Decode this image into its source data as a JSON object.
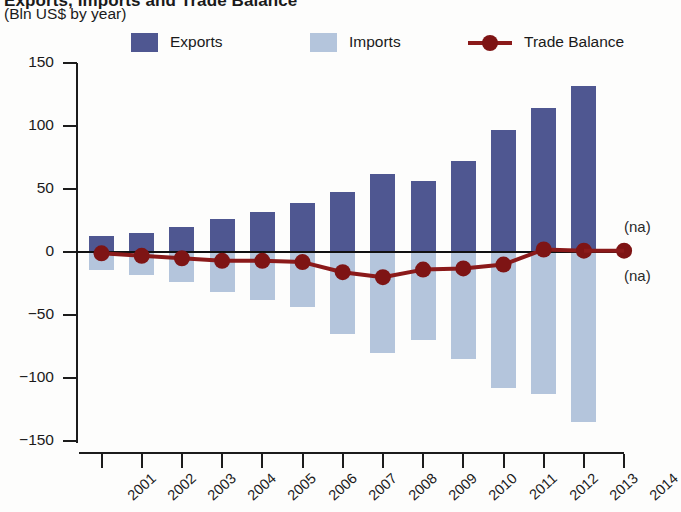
{
  "header": {
    "title_fragment": "Exports, Imports and Trade Balance",
    "subtitle": "(Bln US$ by year)"
  },
  "legend": {
    "position": "top",
    "items": [
      {
        "label": "Exports",
        "marker": "square-swatch",
        "color": "#4f5791"
      },
      {
        "label": "Imports",
        "marker": "square-swatch",
        "color": "#b4c5dc"
      },
      {
        "label": "Trade Balance",
        "marker": "line-with-marker",
        "color": "#8b1a1a"
      }
    ]
  },
  "annotations": [
    {
      "name": "na-upper",
      "text": "(na)",
      "x": 2014,
      "y": 19
    },
    {
      "name": "na-lower",
      "text": "(na)",
      "x": 2014,
      "y": -20
    }
  ],
  "colors": {
    "exports": "#4f5791",
    "imports": "#b4c5dc",
    "trade_balance": "#8b1a1a",
    "trade_balance_marker": "#7e1414",
    "axis": "#1c1c1c",
    "background": "#fdfdfc"
  },
  "chart_data": {
    "type": "bar",
    "title": "Exports, Imports and Trade Balance",
    "subtitle": "(Bln US$ by year)",
    "xlabel": "",
    "ylabel": "Bln US$ by year",
    "categories": [
      "2001",
      "2002",
      "2003",
      "2004",
      "2005",
      "2006",
      "2007",
      "2008",
      "2009",
      "2010",
      "2011",
      "2012",
      "2013",
      "2014"
    ],
    "tick_labels": [
      "2001",
      "2002",
      "2003",
      "2004",
      "2005",
      "2006",
      "2007",
      "2008",
      "2009",
      "2010",
      "2011",
      "2012",
      "2013",
      "2014"
    ],
    "ytick_labels": [
      "150",
      "100",
      "50",
      "0",
      "-50",
      "-100",
      "-150"
    ],
    "ytick_values": [
      150,
      100,
      50,
      0,
      -50,
      -100,
      -150
    ],
    "ylim": [
      -150,
      150
    ],
    "grid": false,
    "series": [
      {
        "name": "Exports",
        "type": "bar",
        "color": "#4f5791",
        "x": [
          "2001",
          "2002",
          "2003",
          "2004",
          "2005",
          "2006",
          "2007",
          "2008",
          "2009",
          "2010",
          "2011",
          "2012",
          "2013"
        ],
        "values": [
          13,
          15,
          20,
          26,
          32,
          39,
          48,
          62,
          56,
          72,
          97,
          114,
          132
        ]
      },
      {
        "name": "Imports",
        "type": "bar",
        "color": "#b4c5dc",
        "x": [
          "2001",
          "2002",
          "2003",
          "2004",
          "2005",
          "2006",
          "2007",
          "2008",
          "2009",
          "2010",
          "2011",
          "2012",
          "2013"
        ],
        "values": [
          -14,
          -18,
          -24,
          -32,
          -38,
          -44,
          -65,
          -80,
          -70,
          -85,
          -108,
          -113,
          -135
        ]
      },
      {
        "name": "Trade Balance",
        "type": "line",
        "color": "#8b1a1a",
        "x": [
          "2001",
          "2002",
          "2003",
          "2004",
          "2005",
          "2006",
          "2007",
          "2008",
          "2009",
          "2010",
          "2011",
          "2012",
          "2013"
        ],
        "values": [
          -1,
          -3,
          -5,
          -7,
          -7,
          -8,
          -16,
          -20,
          -14,
          -13,
          -10,
          2,
          1
        ]
      }
    ]
  }
}
